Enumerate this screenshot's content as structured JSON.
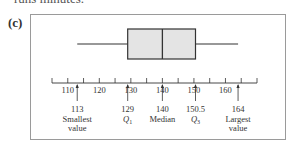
{
  "page": {
    "top_cut_text": "runs minutes.",
    "panel_label": "(c)"
  },
  "chart_data": {
    "type": "boxplot",
    "title": "",
    "xlabel": "",
    "ylabel": "",
    "axis": {
      "min": 105,
      "max": 170,
      "tick_step": 5,
      "labeled_ticks": [
        110,
        120,
        130,
        140,
        150,
        160
      ]
    },
    "five_number_summary": {
      "min": 113,
      "q1": 129,
      "median": 140,
      "q3": 150.5,
      "max": 164
    },
    "annotations": [
      {
        "value": 113,
        "value_label": "113",
        "text": "Smallest",
        "text2": "value"
      },
      {
        "value": 129,
        "value_label": "129",
        "text": "Q1",
        "text2": ""
      },
      {
        "value": 140,
        "value_label": "140",
        "text": "Median",
        "text2": ""
      },
      {
        "value": 150.5,
        "value_label": "150.5",
        "text": "Q3",
        "text2": ""
      },
      {
        "value": 164,
        "value_label": "164",
        "text": "Largest",
        "text2": "value"
      }
    ],
    "colors": {
      "box_fill": "#e4e4e4",
      "stroke": "#333333",
      "frame": "#9a9a9a"
    }
  }
}
